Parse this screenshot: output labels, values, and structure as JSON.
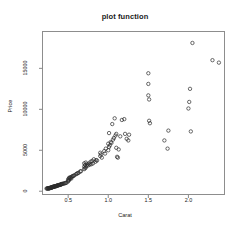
{
  "chart_data": {
    "type": "scatter",
    "title": "plot function",
    "xlabel": "Carat",
    "ylabel": "Price",
    "xlim": [
      0.18,
      2.45
    ],
    "ylim": [
      -400,
      19500
    ],
    "grid": false,
    "legend": null,
    "marker": "open-circle",
    "marker_color": "#2b2b2b",
    "xticks": [
      0.5,
      1.0,
      1.5,
      2.0
    ],
    "xtick_labels": [
      "0.5",
      "1.0",
      "1.5",
      "2.0"
    ],
    "yticks": [
      0,
      5000,
      10000,
      15000
    ],
    "ytick_labels": [
      "0",
      "5000",
      "10000",
      "15000"
    ],
    "series": [
      {
        "name": "diamonds",
        "x": [
          0.23,
          0.24,
          0.24,
          0.25,
          0.25,
          0.26,
          0.26,
          0.26,
          0.27,
          0.27,
          0.27,
          0.28,
          0.28,
          0.28,
          0.29,
          0.29,
          0.3,
          0.3,
          0.3,
          0.3,
          0.31,
          0.31,
          0.31,
          0.32,
          0.32,
          0.32,
          0.33,
          0.33,
          0.34,
          0.34,
          0.35,
          0.35,
          0.35,
          0.36,
          0.36,
          0.37,
          0.37,
          0.38,
          0.38,
          0.39,
          0.4,
          0.4,
          0.41,
          0.41,
          0.42,
          0.42,
          0.43,
          0.44,
          0.45,
          0.46,
          0.47,
          0.48,
          0.5,
          0.5,
          0.5,
          0.51,
          0.51,
          0.52,
          0.52,
          0.53,
          0.54,
          0.54,
          0.55,
          0.56,
          0.57,
          0.58,
          0.6,
          0.61,
          0.62,
          0.63,
          0.65,
          0.66,
          0.7,
          0.7,
          0.7,
          0.71,
          0.71,
          0.72,
          0.72,
          0.73,
          0.74,
          0.75,
          0.76,
          0.77,
          0.78,
          0.79,
          0.8,
          0.81,
          0.82,
          0.84,
          0.85,
          0.86,
          0.9,
          0.9,
          0.91,
          0.92,
          0.95,
          0.96,
          0.97,
          1.0,
          1.0,
          1.01,
          1.01,
          1.02,
          1.03,
          1.04,
          1.05,
          1.06,
          1.07,
          1.08,
          1.09,
          1.1,
          1.1,
          1.11,
          1.12,
          1.13,
          1.15,
          1.17,
          1.2,
          1.21,
          1.23,
          1.25,
          1.26,
          1.5,
          1.5,
          1.5,
          1.51,
          1.51,
          1.52,
          1.7,
          1.74,
          1.75,
          2.0,
          2.01,
          2.02,
          2.03,
          2.05,
          2.3,
          2.38
        ],
        "y": [
          326,
          336,
          340,
          342,
          351,
          357,
          363,
          367,
          371,
          380,
          402,
          404,
          420,
          430,
          441,
          455,
          470,
          480,
          492,
          500,
          510,
          520,
          535,
          545,
          552,
          560,
          570,
          580,
          595,
          605,
          620,
          635,
          650,
          665,
          680,
          700,
          715,
          730,
          745,
          760,
          780,
          800,
          820,
          840,
          865,
          880,
          900,
          925,
          950,
          980,
          1010,
          1040,
          1200,
          1300,
          1450,
          1350,
          1600,
          1500,
          1700,
          1620,
          1750,
          1550,
          1800,
          1860,
          1900,
          1950,
          2100,
          2150,
          2200,
          2250,
          2400,
          2450,
          2700,
          3000,
          3400,
          2800,
          3200,
          2900,
          3500,
          3100,
          3300,
          3150,
          3400,
          3250,
          3600,
          3300,
          3700,
          3400,
          3900,
          3600,
          3800,
          3750,
          4300,
          4700,
          4500,
          4100,
          4900,
          4600,
          5200,
          5000,
          5800,
          5400,
          7100,
          5600,
          6000,
          5900,
          8200,
          6300,
          6500,
          8900,
          6800,
          7000,
          5300,
          4200,
          4100,
          5100,
          6700,
          8700,
          8800,
          7000,
          6400,
          6200,
          6900,
          14400,
          13100,
          11700,
          11200,
          8600,
          8300,
          6200,
          5200,
          7400,
          10100,
          10900,
          12500,
          7300,
          18100,
          16000,
          15700
        ]
      }
    ]
  },
  "axis": {
    "frame_color": "#8a8a8a",
    "tick_color": "#8a8a8a"
  }
}
